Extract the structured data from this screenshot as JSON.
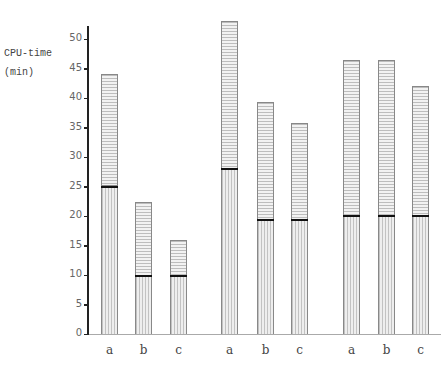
{
  "chart_data": {
    "type": "bar",
    "stacked": true,
    "title": "",
    "ylabel": "CPU-time (min)",
    "ylabel_lines": [
      "CPU-time",
      "(min)"
    ],
    "xlabel": "",
    "ylim": [
      0,
      50
    ],
    "yticks": [
      0,
      5,
      10,
      15,
      20,
      25,
      30,
      35,
      40,
      45,
      50
    ],
    "grid": false,
    "legend": null,
    "groups": [
      {
        "name": "group 1",
        "categories": [
          "a",
          "b",
          "c"
        ],
        "lower": [
          25,
          9.8,
          9.8
        ],
        "total": [
          44,
          22.3,
          16
        ]
      },
      {
        "name": "group 2",
        "categories": [
          "a",
          "b",
          "c"
        ],
        "lower": [
          28,
          19.4,
          19.4
        ],
        "total": [
          53,
          39.4,
          35.7
        ]
      },
      {
        "name": "group 3",
        "categories": [
          "a",
          "b",
          "c"
        ],
        "lower": [
          20,
          20,
          20
        ],
        "total": [
          46.5,
          46.5,
          42
        ]
      }
    ],
    "series": [
      {
        "name": "lower segment (vertical hatching)",
        "values": [
          25,
          9.8,
          9.8,
          28,
          19.4,
          19.4,
          20,
          20,
          20
        ]
      },
      {
        "name": "upper segment (horizontal hatching)",
        "values": [
          19,
          12.5,
          6.2,
          25,
          20,
          16.3,
          26.5,
          26.5,
          22
        ]
      }
    ],
    "categories": [
      "a",
      "b",
      "c",
      "a",
      "b",
      "c",
      "a",
      "b",
      "c"
    ]
  },
  "axis": {
    "ylabel_line1": "CPU-time",
    "ylabel_line2": "(min)",
    "ticks": [
      "0",
      "5",
      "10",
      "15",
      "20",
      "25",
      "30",
      "35",
      "40",
      "45",
      "50"
    ]
  }
}
